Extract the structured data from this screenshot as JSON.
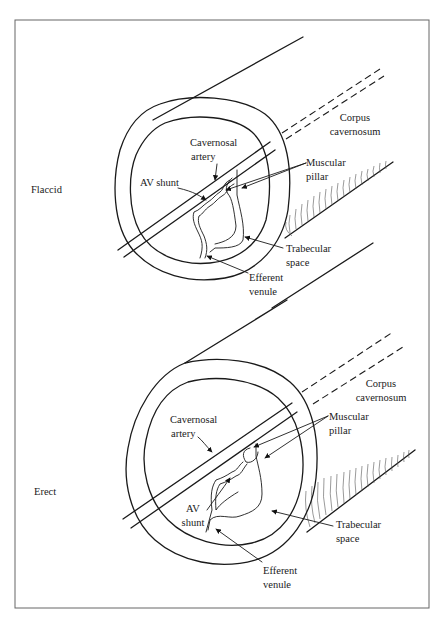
{
  "figure": {
    "panels": [
      {
        "state": "Flaccid",
        "labels": {
          "corpus_line1": "Corpus",
          "corpus_line2": "cavernosum",
          "cavernosal_line1": "Cavernosal",
          "cavernosal_line2": "artery",
          "av_shunt": "AV shunt",
          "muscular_line1": "Muscular",
          "muscular_line2": "pillar",
          "trabecular_line1": "Trabecular",
          "trabecular_line2": "space",
          "efferent_line1": "Efferent",
          "efferent_line2": "venule"
        }
      },
      {
        "state": "Erect",
        "labels": {
          "corpus_line1": "Corpus",
          "corpus_line2": "cavernosum",
          "cavernosal_line1": "Cavernosal",
          "cavernosal_line2": "artery",
          "av_line1": "AV",
          "av_line2": "shunt",
          "muscular_line1": "Muscular",
          "muscular_line2": "pillar",
          "trabecular_line1": "Trabecular",
          "trabecular_line2": "space",
          "efferent_line1": "Efferent",
          "efferent_line2": "venule"
        }
      }
    ],
    "colors": {
      "line": "#1a1a1a",
      "frame": "#666666",
      "background": "#ffffff"
    }
  }
}
